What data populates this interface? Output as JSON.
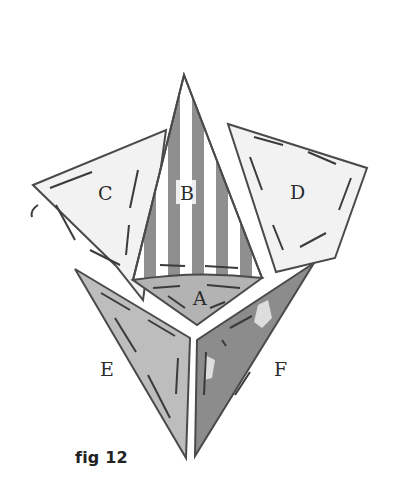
{
  "figure": {
    "caption": "fig 12",
    "pieces": [
      {
        "id": "A",
        "label": "A",
        "fill": "#b3b3b3",
        "description": "curved base segment below B"
      },
      {
        "id": "B",
        "label": "B",
        "fill": "#ffffff",
        "stripe": "#8a8a8a",
        "description": "tall striped triangle, pointing up"
      },
      {
        "id": "C",
        "label": "C",
        "fill": "#f2f2f2",
        "description": "left quadrilateral panel"
      },
      {
        "id": "D",
        "label": "D",
        "fill": "#f2f2f2",
        "description": "right quadrilateral panel"
      },
      {
        "id": "E",
        "label": "E",
        "fill": "#bdbdbd",
        "description": "lower-left triangle"
      },
      {
        "id": "F",
        "label": "F",
        "fill": "#8c8c8c",
        "description": "lower-right dark triangle"
      }
    ],
    "outline_color": "#4a4a4a"
  }
}
